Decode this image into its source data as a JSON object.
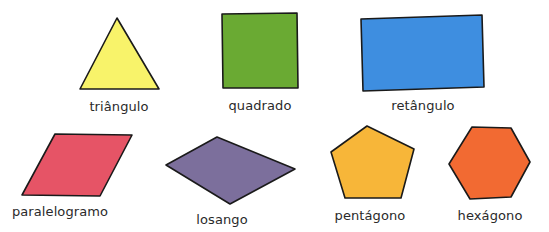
{
  "shapes": [
    {
      "id": "triangle",
      "label": "triângulo",
      "color": "#f8f36a",
      "points": "117,18 159,89 80,89",
      "label_x": 119,
      "label_y": 99
    },
    {
      "id": "square",
      "label": "quadrado",
      "color": "#6aaa33",
      "points": "222,14 297,13 298,88 223,88",
      "label_x": 260,
      "label_y": 98
    },
    {
      "id": "rectangle",
      "label": "retângulo",
      "color": "#3e8ee0",
      "points": "361,19 482,15 484,87 363,91",
      "label_x": 423,
      "label_y": 98
    },
    {
      "id": "parallelogram",
      "label": "paralelogramo",
      "color": "#e65466",
      "points": "55,134 132,135 100,196 22,195",
      "label_x": 60,
      "label_y": 204
    },
    {
      "id": "rhombus",
      "label": "losango",
      "color": "#7c6f9c",
      "points": "166,165 217,137 295,169 230,204",
      "label_x": 222,
      "label_y": 212
    },
    {
      "id": "pentagon",
      "label": "pentágono",
      "color": "#f7b639",
      "points": "367,126 414,149 401,198 345,198 331,152",
      "label_x": 370,
      "label_y": 208
    },
    {
      "id": "hexagon",
      "label": "hexágono",
      "color": "#f26a32",
      "points": "472,127 511,128 530,162 511,197 470,199 449,164",
      "label_x": 490,
      "label_y": 208
    }
  ],
  "outline_color": "#1a1a1a"
}
